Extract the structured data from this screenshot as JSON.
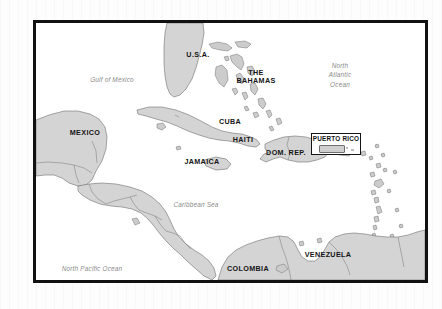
{
  "map": {
    "title": "Caribbean Region Reference Map",
    "frame": {
      "border_color": "#111111",
      "background_color": "#ffffff"
    },
    "palette": {
      "land_fill": "#d4d4d4",
      "land_stroke": "#6f6f6f",
      "water_fill": "#ffffff",
      "country_label_color": "#151515",
      "water_label_color": "#8a8a8a",
      "page_background": "#fdfdfd"
    },
    "country_labels": [
      {
        "id": "usa",
        "text": "U.S.A.",
        "x": 161,
        "y": 33
      },
      {
        "id": "bahamas",
        "text_line1": "THE",
        "text_line2": "BAHAMAS",
        "x": 228,
        "y": 54
      },
      {
        "id": "cuba",
        "text": "CUBA",
        "x": 209,
        "y": 119
      },
      {
        "id": "haiti",
        "text": "HAITI",
        "x": 239,
        "y": 132
      },
      {
        "id": "dom-rep",
        "text": "DOM. REP.",
        "x": 270,
        "y": 143
      },
      {
        "id": "jamaica",
        "text": "JAMAICA",
        "x": 192,
        "y": 158
      },
      {
        "id": "mexico",
        "text": "MEXICO",
        "x": 67,
        "y": 129
      },
      {
        "id": "colombia",
        "text": "COLOMBIA",
        "x": 232,
        "y": 265
      },
      {
        "id": "venezuela",
        "text": "VENEZUELA",
        "x": 312,
        "y": 253
      }
    ],
    "water_labels": [
      {
        "id": "gulf-of-mexico",
        "text": "Gulf of Mexico",
        "x": 104,
        "y": 73
      },
      {
        "id": "north-atlantic-ocean",
        "line1": "North",
        "line2": "Atlantic",
        "line3": "Ocean",
        "x": 338,
        "y": 63
      },
      {
        "id": "caribbean-sea",
        "text": "Caribbean Sea",
        "x": 192,
        "y": 202
      },
      {
        "id": "north-pacific-ocean",
        "text": "North Pacific Ocean",
        "x": 80,
        "y": 265
      }
    ],
    "inset": {
      "id": "puerto-rico-inset",
      "title": "PUERTO RICO",
      "border_color": "#141414",
      "background_color": "#ffffff"
    }
  }
}
